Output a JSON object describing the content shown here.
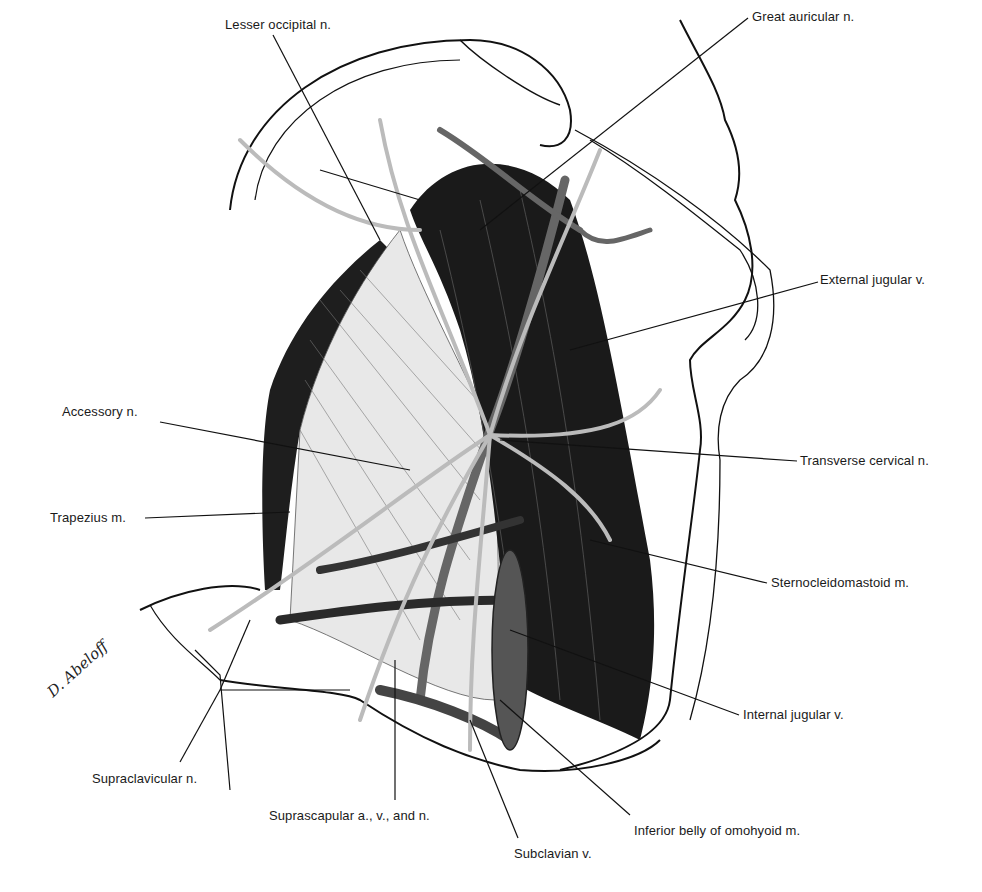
{
  "figure": {
    "type": "anatomical-illustration",
    "signature": "D. Abeloff",
    "labels": [
      {
        "id": "lesser-occipital",
        "text": "Lesser occipital n.",
        "x": 225,
        "y": 17
      },
      {
        "id": "great-auricular",
        "text": "Great auricular n.",
        "x": 752,
        "y": 9
      },
      {
        "id": "external-jugular",
        "text": "External jugular v.",
        "x": 820,
        "y": 272
      },
      {
        "id": "accessory",
        "text": "Accessory n.",
        "x": 62,
        "y": 404
      },
      {
        "id": "transverse-cervical",
        "text": "Transverse cervical n.",
        "x": 800,
        "y": 453
      },
      {
        "id": "trapezius",
        "text": "Trapezius m.",
        "x": 50,
        "y": 510
      },
      {
        "id": "sternocleidomastoid",
        "text": "Sternocleidomastoid m.",
        "x": 771,
        "y": 575
      },
      {
        "id": "internal-jugular",
        "text": "Internal jugular v.",
        "x": 743,
        "y": 707
      },
      {
        "id": "supraclavicular",
        "text": "Supraclavicular n.",
        "x": 92,
        "y": 771
      },
      {
        "id": "suprascapular",
        "text": "Suprascapular a., v., and n.",
        "x": 269,
        "y": 808
      },
      {
        "id": "inferior-belly-omohyoid",
        "text": "Inferior belly of omohyoid m.",
        "x": 634,
        "y": 823
      },
      {
        "id": "subclavian",
        "text": "Subclavian v.",
        "x": 514,
        "y": 846
      }
    ],
    "colors": {
      "ink": "#111111",
      "muscle": "#1e1e1e",
      "vessel": "#6a6a6a",
      "nerve": "#b8b8b8",
      "paper": "#ffffff"
    }
  }
}
